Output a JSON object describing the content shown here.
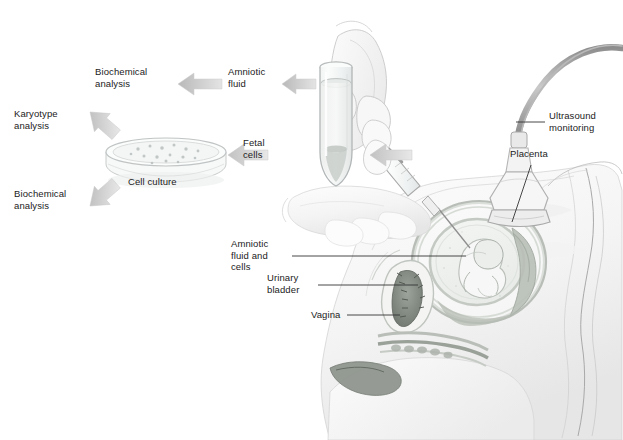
{
  "figure": {
    "background_color": "#ffffff",
    "text_color": "#1b1b1b",
    "arrow_color": "#c9c9c9",
    "leader_line_color": "#3a3a3a",
    "width": 623,
    "height": 440
  },
  "labels": {
    "biochemical_analysis_top": "Biochemical\nanalysis",
    "amniotic_fluid": "Amniotic\nfluid",
    "karyotype_analysis": "Karyotype\nanalysis",
    "fetal_cells": "Fetal\ncells",
    "cell_culture": "Cell culture",
    "biochemical_analysis_bottom": "Biochemical\nanalysis",
    "ultrasound_monitoring": "Ultrasound\nmonitoring",
    "placenta": "Placenta",
    "amniotic_fluid_and_cells": "Amniotic\nfluid and\ncells",
    "urinary_bladder": "Urinary\nbladder",
    "vagina": "Vagina"
  },
  "flow": {
    "steps": [
      "Amniotic fluid withdrawn from uterus under ultrasound monitoring",
      "Sample collected in test tube",
      "Amniotic fluid to biochemical analysis",
      "Fetal cells to cell culture",
      "Cell culture to karyotype analysis",
      "Cell culture to biochemical analysis"
    ],
    "arrow_count": 6
  },
  "anatomy": {
    "structures": [
      "uterus",
      "amniotic sac",
      "fetus",
      "placenta",
      "urinary bladder",
      "vagina",
      "maternal abdomen"
    ]
  },
  "instruments": {
    "items": [
      "ultrasound transducer",
      "transducer cable",
      "syringe",
      "needle",
      "test tube",
      "petri dish"
    ]
  }
}
